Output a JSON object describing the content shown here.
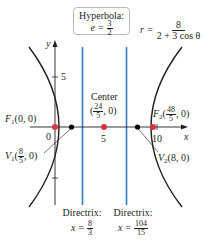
{
  "title_box": {
    "line1": "Hyperbola:",
    "e_label": "e =",
    "e_num": "3",
    "e_den": "2"
  },
  "equation": {
    "lhs": "r =",
    "num": "8",
    "den": "2 + 3 cos θ"
  },
  "axes": {
    "x_label": "x",
    "y_label": "y",
    "y_tick_5": "5",
    "x_tick_0": "0",
    "x_tick_5": "5",
    "x_tick_10": "10"
  },
  "center": {
    "label": "Center",
    "coord_open": "(",
    "num": "24",
    "den": "5",
    "coord_close": ", 0)"
  },
  "focus1": {
    "name": "F",
    "sub": "1",
    "coord": "(0, 0)"
  },
  "focus2": {
    "name": "F",
    "sub": "2",
    "open": "(",
    "num": "48",
    "den": "5",
    "close": ", 0)"
  },
  "vertex1": {
    "name": "V",
    "sub": "1",
    "open": "(",
    "num": "8",
    "den": "5",
    "close": ", 0)"
  },
  "vertex2": {
    "name": "V",
    "sub": "2",
    "coord": "(8, 0)"
  },
  "directrix1": {
    "label": "Directrix:",
    "eq": "x =",
    "num": "8",
    "den": "3"
  },
  "directrix2": {
    "label": "Directrix:",
    "eq": "x =",
    "num": "104",
    "den": "15"
  },
  "colors": {
    "curve": "#231f20",
    "axis": "#231f20",
    "directrix": "#3a7cc4",
    "focus_dot": "#d9363e",
    "vertex_dot": "#000000",
    "box_border": "#b9b9b9"
  },
  "geometry": {
    "center_x": 4.8,
    "a": 3.2,
    "c": 4.8,
    "b_squared": 12.8,
    "eccentricity": 1.5,
    "foci": [
      [
        0,
        0
      ],
      [
        9.6,
        0
      ]
    ],
    "vertices": [
      [
        1.6,
        0
      ],
      [
        8,
        0
      ]
    ],
    "directrices": [
      2.667,
      6.933
    ]
  }
}
